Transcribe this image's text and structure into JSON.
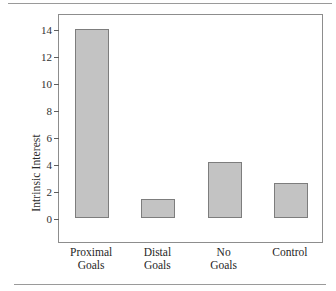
{
  "chart_data": {
    "type": "bar",
    "title": "",
    "xlabel": "",
    "ylabel": "Intrinsic Interest",
    "categories": [
      "Proximal Goals",
      "Distal Goals",
      "No Goals",
      "Control"
    ],
    "category_lines": [
      [
        "Proximal",
        "Goals"
      ],
      [
        "Distal",
        "Goals"
      ],
      [
        "No",
        "Goals"
      ],
      [
        "Control"
      ]
    ],
    "values": [
      14.0,
      1.4,
      4.15,
      2.6
    ],
    "ylim": [
      0,
      14.5
    ],
    "yticks": [
      0,
      2,
      4,
      6,
      8,
      10,
      12,
      14
    ],
    "ytick_labels": [
      "0",
      "2",
      "4",
      "6",
      "8",
      "10",
      "12",
      "14"
    ],
    "grid": false,
    "legend": null,
    "bar_fill_color": "#c3c3c3",
    "bar_border_color": "#7d7d7d",
    "frame_color": "#8d8d8d"
  },
  "figure": {
    "rule_color": "#9a9a9a"
  }
}
